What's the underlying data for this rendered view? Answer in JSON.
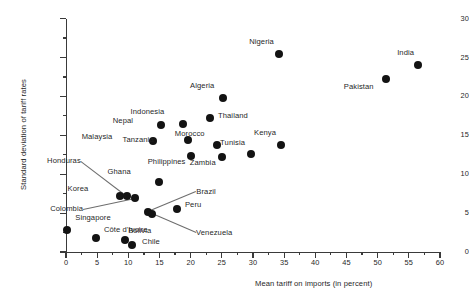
{
  "chart_data": {
    "type": "scatter",
    "title": "",
    "xlabel": "Mean tariff on imports (in percent)",
    "ylabel": "Standard deviation of tariff rates",
    "xlim": [
      0,
      60
    ],
    "ylim": [
      0,
      30
    ],
    "xticks": [
      0,
      5,
      10,
      15,
      20,
      25,
      30,
      35,
      40,
      45,
      50,
      55,
      60
    ],
    "yticks": [
      0,
      5,
      10,
      15,
      20,
      25,
      30
    ],
    "xtick_labels": [
      "0",
      "5",
      "10",
      "15",
      "20",
      "25",
      "30",
      "35",
      "40",
      "45",
      "50",
      "55",
      "60"
    ],
    "ytick_labels": [
      "0",
      "5",
      "10",
      "15",
      "20",
      "25",
      "30"
    ],
    "grid": false,
    "legend": "none",
    "marker": "filled-circle",
    "marker_color": "#131313",
    "points": [
      {
        "label": "Singapore",
        "x": 0.2,
        "y": 2.8,
        "lx": 8,
        "ly": -12,
        "leader": false
      },
      {
        "label": "Côte d'Ivoire",
        "x": 4.8,
        "y": 1.8,
        "lx": 8,
        "ly": -8,
        "leader": false
      },
      {
        "label": "Bolivia",
        "x": 9.5,
        "y": 1.5,
        "lx": 3,
        "ly": -9,
        "leader": false
      },
      {
        "label": "Chile",
        "x": 10.6,
        "y": 0.9,
        "lx": 10,
        "ly": -3,
        "leader": false
      },
      {
        "label": "Korea",
        "x": 8.6,
        "y": 7.2,
        "lx": -31,
        "ly": -7,
        "leader": false
      },
      {
        "label": "Honduras",
        "x": 9.8,
        "y": 7.2,
        "lx": -46,
        "ly": -35,
        "leader": true
      },
      {
        "label": "Colombia",
        "x": 11.1,
        "y": 7.0,
        "lx": -52,
        "ly": 11,
        "leader": true
      },
      {
        "label": "Brazil",
        "x": 13.2,
        "y": 5.1,
        "lx": 48,
        "ly": -20,
        "leader": true
      },
      {
        "label": "Venezuela",
        "x": 13.8,
        "y": 4.9,
        "lx": 44,
        "ly": 19,
        "leader": true
      },
      {
        "label": "Peru",
        "x": 17.8,
        "y": 5.5,
        "lx": 8,
        "ly": -4,
        "leader": false
      },
      {
        "label": "Ghana",
        "x": 15.0,
        "y": 9.0,
        "lx": -29,
        "ly": -10,
        "leader": false
      },
      {
        "label": "Philippines",
        "x": 20.0,
        "y": 12.4,
        "lx": -5,
        "ly": 6,
        "leader": false
      },
      {
        "label": "Zambia",
        "x": 25.0,
        "y": 12.2,
        "lx": -6,
        "ly": 6,
        "leader": false
      },
      {
        "label": "Malaysia",
        "x": 13.9,
        "y": 14.3,
        "lx": -40,
        "ly": -4,
        "leader": false
      },
      {
        "label": "Nepal",
        "x": 15.2,
        "y": 16.3,
        "lx": -28,
        "ly": -4,
        "leader": false
      },
      {
        "label": "Indonesia",
        "x": 18.7,
        "y": 16.4,
        "lx": -18,
        "ly": -12,
        "leader": false
      },
      {
        "label": "Tanzania",
        "x": 19.5,
        "y": 14.4,
        "lx": -34,
        "ly": 0,
        "leader": false
      },
      {
        "label": "Morocco",
        "x": 24.2,
        "y": 13.7,
        "lx": -12,
        "ly": -11,
        "leader": false
      },
      {
        "label": "Thailand",
        "x": 23.1,
        "y": 17.2,
        "lx": 8,
        "ly": -2,
        "leader": false
      },
      {
        "label": "Algeria",
        "x": 25.2,
        "y": 19.8,
        "lx": -9,
        "ly": -12,
        "leader": false
      },
      {
        "label": "Tunisia",
        "x": 29.7,
        "y": 12.6,
        "lx": -6,
        "ly": -11,
        "leader": false
      },
      {
        "label": "Kenya",
        "x": 34.5,
        "y": 13.7,
        "lx": -5,
        "ly": -12,
        "leader": false
      },
      {
        "label": "Nigeria",
        "x": 34.2,
        "y": 25.5,
        "lx": -5,
        "ly": -12,
        "leader": false
      },
      {
        "label": "Pakistan",
        "x": 51.3,
        "y": 22.3,
        "lx": -12,
        "ly": 8,
        "leader": false
      },
      {
        "label": "India",
        "x": 56.5,
        "y": 24.1,
        "lx": -4,
        "ly": -12,
        "leader": false
      }
    ]
  }
}
